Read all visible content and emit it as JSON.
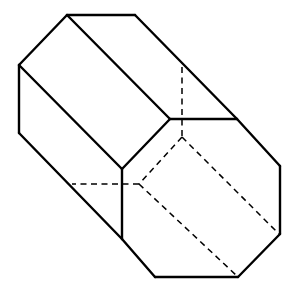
{
  "diagram": {
    "title": "",
    "colors": {
      "line": "#000000",
      "background": "#ffffff"
    },
    "solid_edges": [
      [
        67,
        15,
        135,
        15
      ],
      [
        135,
        15,
        237,
        119
      ],
      [
        67,
        15,
        19,
        65
      ],
      [
        19,
        65,
        19,
        133
      ],
      [
        19,
        133,
        122,
        239
      ],
      [
        122,
        239,
        155,
        277
      ],
      [
        155,
        277,
        238,
        277
      ],
      [
        238,
        277,
        280,
        234
      ],
      [
        280,
        234,
        280,
        166
      ],
      [
        280,
        166,
        237,
        119
      ],
      [
        67,
        15,
        170,
        119
      ],
      [
        19,
        65,
        122,
        169
      ],
      [
        122,
        169,
        170,
        119
      ],
      [
        170,
        119,
        237,
        119
      ],
      [
        122,
        169,
        122,
        239
      ]
    ],
    "hidden_edges": [
      [
        182,
        67,
        182,
        137
      ],
      [
        182,
        137,
        139,
        184
      ],
      [
        182,
        137,
        279,
        234
      ],
      [
        139,
        184,
        72,
        184
      ],
      [
        139,
        184,
        237,
        276
      ]
    ]
  }
}
